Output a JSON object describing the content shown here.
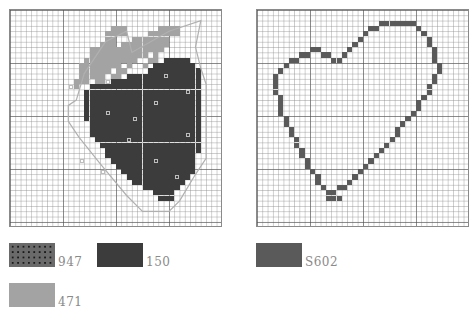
{
  "colors": {
    "dark": "#3c3c3c",
    "light": "#a3a3a3",
    "heart": "#5a5a5a",
    "outline": "#b0b0b0"
  },
  "left_chart": {
    "name": "strawberry",
    "cols": 40,
    "rows": 41,
    "light_rows": [
      [
        3,
        19,
        21
      ],
      [
        3,
        28,
        31
      ],
      [
        4,
        18,
        21
      ],
      [
        4,
        26,
        31
      ],
      [
        5,
        18,
        19
      ],
      [
        5,
        23,
        29
      ],
      [
        6,
        17,
        19
      ],
      [
        6,
        21,
        29
      ],
      [
        7,
        15,
        28
      ],
      [
        8,
        15,
        25
      ],
      [
        8,
        27,
        27
      ],
      [
        9,
        14,
        23
      ],
      [
        9,
        26,
        27
      ],
      [
        10,
        13,
        20
      ],
      [
        10,
        22,
        22
      ],
      [
        10,
        25,
        25
      ],
      [
        11,
        13,
        18
      ],
      [
        11,
        20,
        21
      ],
      [
        12,
        13,
        17
      ],
      [
        12,
        19,
        20
      ],
      [
        13,
        12,
        14
      ],
      [
        13,
        16,
        17
      ],
      [
        14,
        12,
        12
      ]
    ],
    "dark_rows": [
      [
        9,
        29,
        33
      ],
      [
        10,
        27,
        34
      ],
      [
        11,
        26,
        35
      ],
      [
        12,
        22,
        35
      ],
      [
        13,
        19,
        35
      ],
      [
        14,
        15,
        35
      ],
      [
        15,
        14,
        35
      ],
      [
        16,
        14,
        35
      ],
      [
        17,
        14,
        35
      ],
      [
        18,
        14,
        35
      ],
      [
        19,
        14,
        35
      ],
      [
        20,
        14,
        35
      ],
      [
        21,
        15,
        35
      ],
      [
        22,
        15,
        35
      ],
      [
        23,
        15,
        35
      ],
      [
        24,
        16,
        35
      ],
      [
        25,
        17,
        35
      ],
      [
        26,
        18,
        35
      ],
      [
        27,
        18,
        34
      ],
      [
        28,
        19,
        34
      ],
      [
        29,
        20,
        34
      ],
      [
        30,
        21,
        34
      ],
      [
        31,
        22,
        33
      ],
      [
        32,
        23,
        32
      ],
      [
        33,
        25,
        31
      ],
      [
        34,
        27,
        30
      ],
      [
        35,
        28,
        30
      ]
    ],
    "dots": [
      [
        18,
        13
      ],
      [
        29,
        12
      ],
      [
        18,
        19
      ],
      [
        33,
        15
      ],
      [
        27,
        17
      ],
      [
        11,
        14
      ],
      [
        23,
        20
      ],
      [
        33,
        23
      ],
      [
        22,
        24
      ],
      [
        13,
        28
      ],
      [
        27,
        28
      ],
      [
        17,
        30
      ],
      [
        31,
        31
      ]
    ],
    "outline_points": [
      [
        12.5,
        17
      ],
      [
        14,
        12
      ],
      [
        18,
        6
      ],
      [
        22,
        4
      ],
      [
        23,
        8
      ],
      [
        30,
        4
      ],
      [
        36,
        2
      ],
      [
        35,
        7
      ],
      [
        36,
        11
      ],
      [
        37,
        14
      ],
      [
        37,
        28
      ],
      [
        35,
        31
      ],
      [
        32,
        36
      ],
      [
        30,
        38
      ],
      [
        25,
        38
      ],
      [
        22,
        35
      ],
      [
        17,
        29
      ],
      [
        13,
        24
      ],
      [
        11,
        21
      ],
      [
        11,
        18
      ]
    ]
  },
  "right_chart": {
    "name": "heart",
    "cols": 40,
    "rows": 41,
    "outline_cells": [
      [
        23,
        2
      ],
      [
        24,
        2
      ],
      [
        25,
        2
      ],
      [
        26,
        2
      ],
      [
        27,
        2
      ],
      [
        28,
        2
      ],
      [
        29,
        2
      ],
      [
        21,
        3
      ],
      [
        22,
        3
      ],
      [
        30,
        3
      ],
      [
        20,
        4
      ],
      [
        31,
        4
      ],
      [
        19,
        5
      ],
      [
        32,
        5
      ],
      [
        18,
        6
      ],
      [
        32,
        6
      ],
      [
        10,
        7
      ],
      [
        11,
        7
      ],
      [
        17,
        7
      ],
      [
        33,
        7
      ],
      [
        8,
        8
      ],
      [
        9,
        8
      ],
      [
        12,
        8
      ],
      [
        13,
        8
      ],
      [
        16,
        8
      ],
      [
        33,
        8
      ],
      [
        6,
        9
      ],
      [
        7,
        9
      ],
      [
        14,
        9
      ],
      [
        15,
        9
      ],
      [
        33,
        9
      ],
      [
        5,
        10
      ],
      [
        34,
        10
      ],
      [
        4,
        11
      ],
      [
        34,
        11
      ],
      [
        3,
        12
      ],
      [
        33,
        12
      ],
      [
        3,
        13
      ],
      [
        33,
        13
      ],
      [
        3,
        14
      ],
      [
        32,
        14
      ],
      [
        3,
        15
      ],
      [
        32,
        15
      ],
      [
        4,
        16
      ],
      [
        31,
        16
      ],
      [
        4,
        17
      ],
      [
        30,
        17
      ],
      [
        4,
        18
      ],
      [
        30,
        18
      ],
      [
        4,
        19
      ],
      [
        29,
        19
      ],
      [
        5,
        20
      ],
      [
        28,
        20
      ],
      [
        5,
        21
      ],
      [
        27,
        21
      ],
      [
        6,
        22
      ],
      [
        26,
        22
      ],
      [
        6,
        23
      ],
      [
        26,
        23
      ],
      [
        7,
        24
      ],
      [
        25,
        24
      ],
      [
        7,
        25
      ],
      [
        24,
        25
      ],
      [
        8,
        26
      ],
      [
        23,
        26
      ],
      [
        8,
        27
      ],
      [
        22,
        27
      ],
      [
        9,
        28
      ],
      [
        21,
        28
      ],
      [
        9,
        29
      ],
      [
        20,
        29
      ],
      [
        10,
        30
      ],
      [
        19,
        30
      ],
      [
        11,
        31
      ],
      [
        18,
        31
      ],
      [
        11,
        32
      ],
      [
        17,
        32
      ],
      [
        12,
        33
      ],
      [
        15,
        33
      ],
      [
        16,
        33
      ],
      [
        13,
        34
      ],
      [
        14,
        34
      ],
      [
        13,
        35
      ],
      [
        14,
        35
      ],
      [
        15,
        35
      ]
    ]
  },
  "legend": [
    {
      "code": "947",
      "style": "dotted-dark",
      "color": "#555555"
    },
    {
      "code": "150",
      "style": "solid",
      "color": "#3c3c3c"
    },
    {
      "code": "471",
      "style": "solid",
      "color": "#a3a3a3"
    },
    {
      "code": "S602",
      "style": "solid",
      "color": "#5a5a5a"
    }
  ]
}
